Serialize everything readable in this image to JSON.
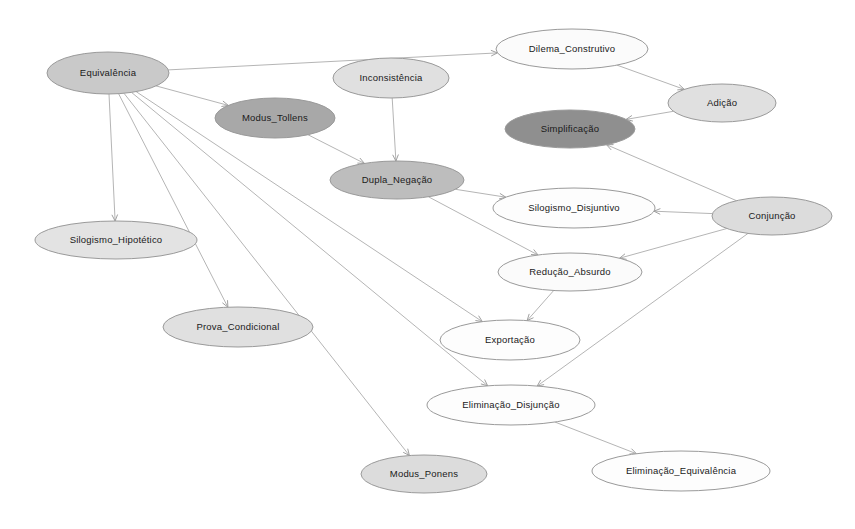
{
  "diagram": {
    "type": "directed-graph",
    "background_color": "#ffffff",
    "edge_color": "#b5b5b5",
    "node_border_color": "#9a9a9a",
    "label_color": "#1a1a1a",
    "fills": {
      "white": "#fdfdfd",
      "light": "#e3e3e3",
      "medium": "#bdbdbd",
      "dark": "#9a9a9a"
    },
    "nodes": [
      {
        "id": "equivalencia",
        "label": "Equivalência",
        "cx": 108,
        "cy": 73,
        "rx": 61,
        "ry": 21,
        "fill": "#c9c9c9"
      },
      {
        "id": "inconsistencia",
        "label": "Inconsistência",
        "cx": 391,
        "cy": 78,
        "rx": 58,
        "ry": 20,
        "fill": "#e0e0e0"
      },
      {
        "id": "dilema_construtivo",
        "label": "Dilema_Construtivo",
        "cx": 572,
        "cy": 49,
        "rx": 76,
        "ry": 20,
        "fill": "#fbfbfb"
      },
      {
        "id": "adicao",
        "label": "Adição",
        "cx": 722,
        "cy": 103,
        "rx": 54,
        "ry": 19,
        "fill": "#e0e0e0"
      },
      {
        "id": "modus_tollens",
        "label": "Modus_Tollens",
        "cx": 275,
        "cy": 118,
        "rx": 60,
        "ry": 20,
        "fill": "#a8a8a8"
      },
      {
        "id": "simplificacao",
        "label": "Simplificação",
        "cx": 570,
        "cy": 129,
        "rx": 65,
        "ry": 19,
        "fill": "#8f8f8f"
      },
      {
        "id": "dupla_negacao",
        "label": "Dupla_Negação",
        "cx": 397,
        "cy": 180,
        "rx": 67,
        "ry": 19,
        "fill": "#bdbdbd"
      },
      {
        "id": "silogismo_disjuntivo",
        "label": "Silogismo_Disjuntivo",
        "cx": 574,
        "cy": 208,
        "rx": 81,
        "ry": 20,
        "fill": "#fdfdfd"
      },
      {
        "id": "conjuncao",
        "label": "Conjunção",
        "cx": 772,
        "cy": 216,
        "rx": 60,
        "ry": 19,
        "fill": "#dcdcdc"
      },
      {
        "id": "silogismo_hipotetico",
        "label": "Silogismo_Hipotético",
        "cx": 116,
        "cy": 240,
        "rx": 81,
        "ry": 19,
        "fill": "#e3e3e3"
      },
      {
        "id": "reducao_absurdo",
        "label": "Redução_Absurdo",
        "cx": 570,
        "cy": 272,
        "rx": 72,
        "ry": 19,
        "fill": "#fbfbfb"
      },
      {
        "id": "prova_condicional",
        "label": "Prova_Condicional",
        "cx": 238,
        "cy": 327,
        "rx": 75,
        "ry": 20,
        "fill": "#e0e0e0"
      },
      {
        "id": "exportacao",
        "label": "Exportação",
        "cx": 510,
        "cy": 340,
        "rx": 70,
        "ry": 20,
        "fill": "#fdfdfd"
      },
      {
        "id": "eliminacao_disjuncao",
        "label": "Eliminação_Disjunção",
        "cx": 511,
        "cy": 405,
        "rx": 84,
        "ry": 20,
        "fill": "#fdfdfd"
      },
      {
        "id": "modus_ponens",
        "label": "Modus_Ponens",
        "cx": 424,
        "cy": 474,
        "rx": 63,
        "ry": 19,
        "fill": "#dcdcdc"
      },
      {
        "id": "eliminacao_equivalencia",
        "label": "Eliminação_Equivalência",
        "cx": 681,
        "cy": 471,
        "rx": 89,
        "ry": 20,
        "fill": "#fdfdfd"
      }
    ],
    "edges": [
      {
        "from": "equivalencia",
        "to": "dilema_construtivo"
      },
      {
        "from": "equivalencia",
        "to": "modus_tollens"
      },
      {
        "from": "equivalencia",
        "to": "silogismo_hipotetico"
      },
      {
        "from": "equivalencia",
        "to": "prova_condicional"
      },
      {
        "from": "equivalencia",
        "to": "exportacao"
      },
      {
        "from": "equivalencia",
        "to": "eliminacao_disjuncao"
      },
      {
        "from": "equivalencia",
        "to": "modus_ponens"
      },
      {
        "from": "inconsistencia",
        "to": "dupla_negacao"
      },
      {
        "from": "dilema_construtivo",
        "to": "adicao"
      },
      {
        "from": "adicao",
        "to": "simplificacao"
      },
      {
        "from": "modus_tollens",
        "to": "dupla_negacao"
      },
      {
        "from": "dupla_negacao",
        "to": "silogismo_disjuntivo"
      },
      {
        "from": "dupla_negacao",
        "to": "reducao_absurdo"
      },
      {
        "from": "conjuncao",
        "to": "simplificacao"
      },
      {
        "from": "conjuncao",
        "to": "silogismo_disjuntivo"
      },
      {
        "from": "conjuncao",
        "to": "reducao_absurdo"
      },
      {
        "from": "conjuncao",
        "to": "eliminacao_disjuncao"
      },
      {
        "from": "reducao_absurdo",
        "to": "exportacao"
      },
      {
        "from": "eliminacao_disjuncao",
        "to": "eliminacao_equivalencia"
      }
    ]
  }
}
